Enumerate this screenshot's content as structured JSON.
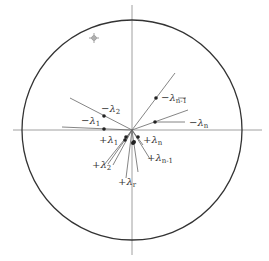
{
  "diagram": {
    "type": "unit-circle-eigenvalue-plot",
    "circle": {
      "cx": 132,
      "cy": 130,
      "r": 110
    },
    "axes": {
      "horizontal": {
        "x1": 13,
        "x2": 262,
        "y": 130
      },
      "vertical": {
        "x": 132,
        "y1": 5,
        "y2": 255
      }
    },
    "marker_symbol": {
      "x": 94,
      "y": 38,
      "glyph": "✧"
    },
    "negative_labels": [
      {
        "id": "neg-lambda-2",
        "sign": "−",
        "symbol": "λ",
        "sub": "2",
        "x": 101,
        "y": 112
      },
      {
        "id": "neg-lambda-1",
        "sign": "−",
        "symbol": "λ",
        "sub": "1",
        "x": 81,
        "y": 124
      },
      {
        "id": "neg-lambda-n-1",
        "sign": "−",
        "symbol": "λ",
        "sub": "n-1",
        "x": 161,
        "y": 101
      },
      {
        "id": "neg-lambda-n",
        "sign": "−",
        "symbol": "λ",
        "sub": "n",
        "x": 189,
        "y": 126
      }
    ],
    "positive_labels": [
      {
        "id": "pos-lambda-1",
        "sign": "+",
        "symbol": "λ",
        "sub": "1",
        "x": 99,
        "y": 143
      },
      {
        "id": "pos-lambda-2",
        "sign": "+",
        "symbol": "λ",
        "sub": "2",
        "x": 92,
        "y": 168
      },
      {
        "id": "pos-lambda-n",
        "sign": "+",
        "symbol": "λ",
        "sub": "n",
        "x": 143,
        "y": 143
      },
      {
        "id": "pos-lambda-n-1",
        "sign": "+",
        "symbol": "λ",
        "sub": "n-1",
        "x": 147,
        "y": 161
      },
      {
        "id": "pos-lambda-r",
        "sign": "+",
        "symbol": "λ",
        "sub": "r",
        "x": 118,
        "y": 185
      }
    ]
  }
}
